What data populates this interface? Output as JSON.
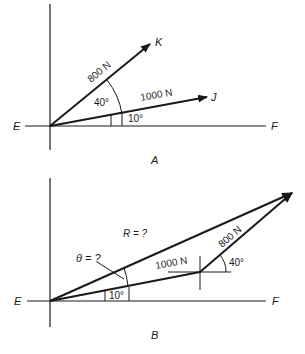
{
  "figure_a": {
    "caption": "A",
    "axis_left_label": "E",
    "axis_right_label": "F",
    "vectors": [
      {
        "name": "K",
        "magnitude_label": "800 N",
        "angle_from_EF_deg": 50
      },
      {
        "name": "J",
        "magnitude_label": "1000 N",
        "angle_from_EF_deg": 10
      }
    ],
    "angle_between_label": "40°",
    "angle_j_label": "10°"
  },
  "figure_b": {
    "caption": "B",
    "axis_left_label": "E",
    "axis_right_label": "F",
    "resultant_label": "R = ?",
    "theta_label": "θ = ?",
    "first_vector_label": "1000 N",
    "second_vector_label": "800 N",
    "second_vector_angle_label": "40°",
    "first_vector_angle_label": "10°"
  },
  "colors": {
    "ink": "#1a1a1a",
    "background": "#ffffff"
  }
}
